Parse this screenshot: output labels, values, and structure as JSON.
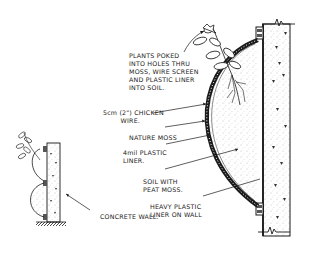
{
  "diagram": {
    "type": "cross-section illustration",
    "colors": {
      "ink": "#1a1a1a",
      "background": "#ffffff",
      "stipple": "#555555"
    },
    "labels": {
      "plants": "PLANTS POKED\nINTO HOLES THRU\nMOSS, WIRE SCREEN\nAND PLASTIC LINER\nINTO SOIL.",
      "chicken_wire": "5cm (2\") CHICKEN\n        WIRE.",
      "nature_moss": "NATURE MOSS",
      "plastic_liner": "4mil PLASTIC\nLINER.",
      "soil": "SOIL WITH\nPEAT MOSS.",
      "heavy_liner": "HEAVY PLASTIC\nLINER ON WALL",
      "concrete_wall": "CONCRETE WALL."
    }
  }
}
